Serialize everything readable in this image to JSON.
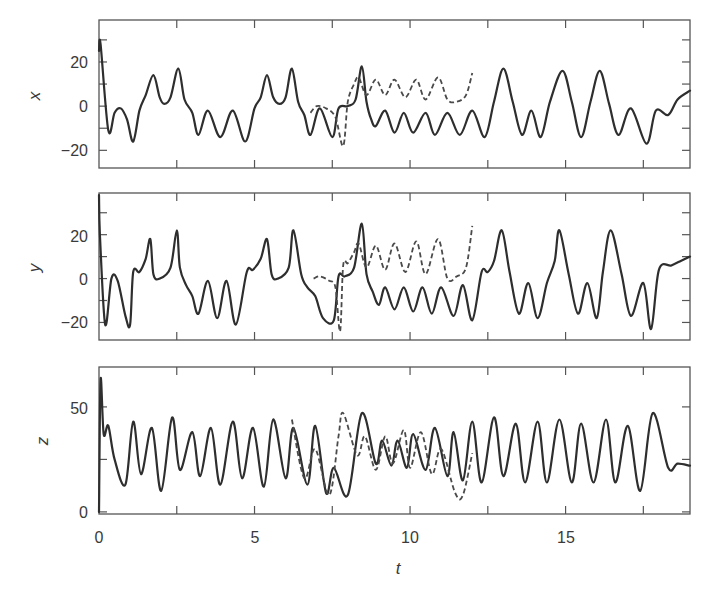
{
  "chart_data": {
    "type": "line",
    "title": "",
    "layout": "3 vertically stacked panels sharing t axis",
    "xlabel": "t",
    "xlim": [
      0,
      19
    ],
    "xticks": [
      0,
      2.5,
      5,
      7.5,
      10,
      12.5,
      15,
      17.5
    ],
    "xtick_labels": [
      "0",
      "5",
      "10",
      "15"
    ],
    "xtick_label_values": [
      0,
      5,
      10,
      15
    ],
    "grid": false,
    "legend": "none",
    "series_styles": {
      "solid": "reference trajectory",
      "dashed": "perturbed trajectory (ends near t=12)"
    },
    "panels": [
      {
        "ylabel": "x",
        "ylim": [
          -28,
          39
        ],
        "yticks": [
          -20,
          -10,
          0,
          10,
          20,
          30
        ],
        "ytick_labels": [
          "-20",
          "0",
          "20"
        ],
        "ytick_label_values": [
          -20,
          0,
          20
        ],
        "series": [
          {
            "name": "solid",
            "style": "solid",
            "t": [
              0,
              0.05,
              0.3,
              0.5,
              0.7,
              0.9,
              1.1,
              1.3,
              1.5,
              1.75,
              1.95,
              2.1,
              2.3,
              2.55,
              2.75,
              3.0,
              3.2,
              3.5,
              3.9,
              4.3,
              4.7,
              5.0,
              5.2,
              5.4,
              5.6,
              5.8,
              6.0,
              6.2,
              6.4,
              6.6,
              6.8,
              7.1,
              7.5,
              7.7,
              8.0,
              8.25,
              8.45,
              8.6,
              8.75,
              8.9,
              9.2,
              9.5,
              9.8,
              10.1,
              10.5,
              10.8,
              11.2,
              11.6,
              12.0,
              12.4,
              12.7,
              13.0,
              13.3,
              13.6,
              13.9,
              14.2,
              14.5,
              14.9,
              15.2,
              15.5,
              15.8,
              16.1,
              16.4,
              16.7,
              17.1,
              17.6,
              17.9,
              18.3,
              18.6,
              19.0
            ],
            "values": [
              25,
              28,
              -11,
              -3,
              -1,
              -6,
              -16,
              -2,
              5,
              14,
              4,
              1,
              4,
              17,
              3,
              -3,
              -13,
              -2,
              -14,
              -2,
              -16,
              -1,
              4,
              14,
              4,
              1,
              4,
              17,
              2,
              -4,
              -13,
              -1,
              -14,
              -1,
              0,
              3,
              18,
              2,
              -6,
              -9,
              -2,
              -12,
              -3,
              -12,
              -3,
              -13,
              -3,
              -13,
              -2,
              -14,
              2,
              17,
              2,
              -13,
              -2,
              -14,
              2,
              16,
              2,
              -14,
              2,
              16,
              1,
              -13,
              -1,
              -17,
              -2,
              -4,
              3,
              7
            ]
          },
          {
            "name": "dashed",
            "style": "dashed",
            "t": [
              6.8,
              7.0,
              7.3,
              7.6,
              7.85,
              8.0,
              8.2,
              8.35,
              8.6,
              8.9,
              9.2,
              9.5,
              9.85,
              10.2,
              10.5,
              10.9,
              11.2,
              11.5,
              11.8,
              12.0
            ],
            "values": [
              -3,
              0,
              -1,
              -5,
              -18,
              2,
              10,
              13,
              5,
              12,
              5,
              12,
              4,
              12,
              3,
              13,
              3,
              2,
              5,
              15
            ]
          }
        ]
      },
      {
        "ylabel": "y",
        "ylim": [
          -28,
          39
        ],
        "yticks": [
          -20,
          -10,
          0,
          10,
          20,
          30
        ],
        "ytick_labels": [
          "-20",
          "0",
          "20"
        ],
        "ytick_label_values": [
          -20,
          0,
          20
        ],
        "series": [
          {
            "name": "solid",
            "style": "solid",
            "t": [
              0,
              0.03,
              0.2,
              0.4,
              0.6,
              0.85,
              1.0,
              1.1,
              1.3,
              1.5,
              1.65,
              1.75,
              1.95,
              2.3,
              2.5,
              2.6,
              2.8,
              3.0,
              3.2,
              3.5,
              3.8,
              4.1,
              4.4,
              4.75,
              4.95,
              5.2,
              5.4,
              5.55,
              5.75,
              6.1,
              6.25,
              6.5,
              6.7,
              6.95,
              7.2,
              7.55,
              7.7,
              7.9,
              8.2,
              8.45,
              8.6,
              8.8,
              9.0,
              9.2,
              9.5,
              9.8,
              10.1,
              10.4,
              10.7,
              11.0,
              11.4,
              11.7,
              12.0,
              12.3,
              12.5,
              12.7,
              12.95,
              13.2,
              13.5,
              13.8,
              14.1,
              14.4,
              14.65,
              14.8,
              15.1,
              15.4,
              15.7,
              16.0,
              16.2,
              16.45,
              16.8,
              17.1,
              17.5,
              17.75,
              18.0,
              18.4,
              18.7,
              19.0
            ],
            "values": [
              38,
              20,
              -21,
              0,
              -1,
              -17,
              -21,
              3,
              3,
              9,
              18,
              2,
              0,
              5,
              22,
              5,
              -3,
              -8,
              -16,
              -1,
              -18,
              -1,
              -21,
              3,
              4,
              9,
              18,
              2,
              0,
              5,
              22,
              2,
              -4,
              -8,
              -18,
              -19,
              1,
              1,
              5,
              25,
              2,
              -6,
              -12,
              -4,
              -14,
              -4,
              -15,
              -4,
              -16,
              -4,
              -17,
              -3,
              -19,
              3,
              3,
              8,
              22,
              3,
              -16,
              -2,
              -18,
              -2,
              8,
              22,
              2,
              -16,
              -2,
              -18,
              3,
              22,
              2,
              -17,
              -2,
              -23,
              4,
              6,
              8,
              10
            ]
          },
          {
            "name": "dashed",
            "style": "dashed",
            "t": [
              6.9,
              7.1,
              7.4,
              7.6,
              7.75,
              7.85,
              8.0,
              8.2,
              8.35,
              8.6,
              8.9,
              9.2,
              9.5,
              9.85,
              10.2,
              10.5,
              10.9,
              11.2,
              11.5,
              11.8,
              12.0
            ],
            "values": [
              0,
              1,
              -1,
              -4,
              -24,
              6,
              7,
              12,
              16,
              5,
              15,
              4,
              16,
              3,
              17,
              2,
              18,
              0,
              1,
              5,
              24
            ]
          }
        ]
      },
      {
        "ylabel": "z",
        "ylim": [
          -1,
          69
        ],
        "yticks": [
          0,
          25,
          50
        ],
        "ytick_labels": [
          "0",
          "50"
        ],
        "ytick_label_values": [
          0,
          50
        ],
        "series": [
          {
            "name": "solid",
            "style": "solid",
            "t": [
              0,
              0.05,
              0.15,
              0.3,
              0.5,
              0.85,
              1.1,
              1.35,
              1.7,
              2.0,
              2.35,
              2.6,
              3.0,
              3.25,
              3.6,
              3.9,
              4.3,
              4.6,
              4.95,
              5.3,
              5.6,
              6.0,
              6.25,
              6.7,
              6.95,
              7.3,
              7.55,
              8.0,
              8.45,
              8.9,
              9.1,
              9.4,
              9.6,
              9.9,
              10.1,
              10.5,
              10.8,
              11.2,
              11.4,
              11.7,
              12.0,
              12.3,
              12.7,
              13.0,
              13.4,
              13.7,
              14.1,
              14.4,
              14.8,
              15.2,
              15.5,
              15.9,
              16.3,
              16.6,
              17.0,
              17.4,
              17.8,
              18.3,
              18.6,
              19.0
            ],
            "values": [
              0,
              63,
              37,
              41,
              25,
              13,
              43,
              18,
              40,
              10,
              45,
              20,
              38,
              17,
              40,
              13,
              43,
              16,
              40,
              12,
              44,
              16,
              40,
              13,
              41,
              9,
              21,
              8,
              47,
              23,
              34,
              22,
              34,
              21,
              37,
              20,
              40,
              17,
              38,
              15,
              43,
              14,
              45,
              17,
              42,
              14,
              43,
              14,
              44,
              14,
              42,
              14,
              44,
              14,
              41,
              10,
              47,
              21,
              23,
              22
            ]
          },
          {
            "name": "dashed",
            "style": "dashed",
            "t": [
              6.2,
              6.6,
              6.95,
              7.4,
              7.7,
              7.85,
              8.3,
              8.55,
              8.9,
              9.2,
              9.45,
              9.8,
              10.0,
              10.35,
              10.7,
              11.0,
              11.45,
              11.7,
              12.0
            ],
            "values": [
              44,
              16,
              30,
              8,
              36,
              47,
              27,
              36,
              20,
              36,
              23,
              39,
              21,
              38,
              18,
              30,
              9,
              8,
              28
            ]
          }
        ]
      }
    ]
  },
  "axes": {
    "x_title": "t",
    "x_tick_labels": [
      "0",
      "5",
      "10",
      "15"
    ],
    "panel_1": {
      "y_title": "x",
      "tick_labels": [
        "20",
        "0",
        "−20"
      ]
    },
    "panel_2": {
      "y_title": "y",
      "tick_labels": [
        "20",
        "0",
        "−20"
      ]
    },
    "panel_3": {
      "y_title": "z",
      "tick_labels": [
        "50",
        "0"
      ]
    }
  }
}
